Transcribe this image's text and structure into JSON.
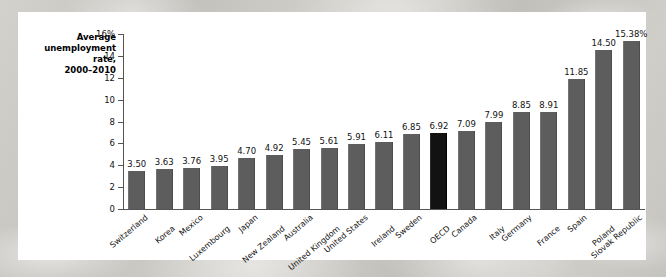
{
  "chart_data": {
    "type": "bar",
    "title": "",
    "ylabel": "Average unemployment rate, 2000-2010",
    "ylabel_lines": [
      "Average",
      "unemployment",
      "rate,",
      "2000–2010"
    ],
    "xlabel": "",
    "ylim": [
      0,
      16
    ],
    "ytick_values": [
      0,
      2,
      4,
      6,
      8,
      10,
      12,
      14,
      16
    ],
    "ytick_labels": [
      "0",
      "2",
      "4",
      "6",
      "8",
      "10",
      "12",
      "14",
      "16%"
    ],
    "grid": false,
    "legend": null,
    "value_label_suffix_last": "%",
    "categories": [
      "Switzerland",
      "Korea",
      "Mexico",
      "Luxembourg",
      "Japan",
      "New Zealand",
      "Australia",
      "United Kingdom",
      "United States",
      "Ireland",
      "Sweden",
      "OECD",
      "Canada",
      "Italy",
      "Germany",
      "France",
      "Spain",
      "Poland",
      "Slovak Republic"
    ],
    "values": [
      3.5,
      3.63,
      3.76,
      3.95,
      4.7,
      4.92,
      5.45,
      5.61,
      5.91,
      6.11,
      6.85,
      6.92,
      7.09,
      7.99,
      8.85,
      8.91,
      11.85,
      14.5,
      15.38
    ],
    "value_labels": [
      "3.50",
      "3.63",
      "3.76",
      "3.95",
      "4.70",
      "4.92",
      "5.45",
      "5.61",
      "5.91",
      "6.11",
      "6.85",
      "6.92",
      "7.09",
      "7.99",
      "8.85",
      "8.91",
      "11.85",
      "14.50",
      "15.38%"
    ],
    "highlight_category": "OECD",
    "colors": {
      "bar": "#5d5d5d",
      "bar_highlight": "#121212",
      "axis": "#555555",
      "text": "#111111",
      "panel_background": "#ffffff",
      "page_background": "#c9c7c2"
    }
  }
}
